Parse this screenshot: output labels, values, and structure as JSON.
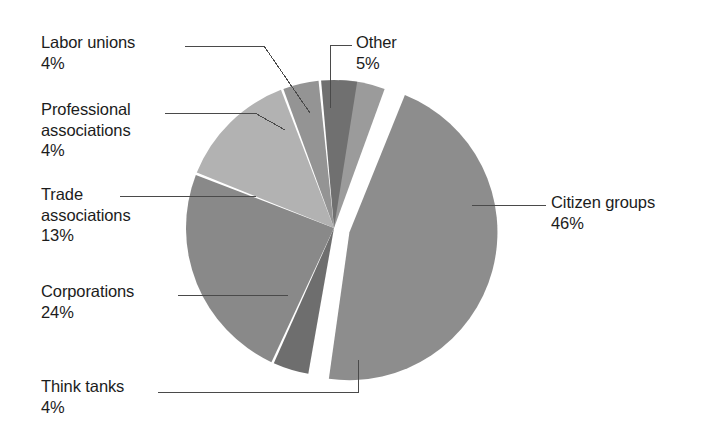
{
  "chart_data": {
    "type": "pie",
    "title": "",
    "subtitle": "",
    "xlabel": "",
    "ylabel": "",
    "legend_position": "none",
    "grid": false,
    "unit": "%",
    "categories": [
      "Other",
      "Citizen groups",
      "Think tanks",
      "Corporations",
      "Trade associations",
      "Professional associations",
      "Labor unions"
    ],
    "values": [
      5,
      46,
      4,
      24,
      13,
      4,
      4
    ],
    "slices": [
      {
        "id": "other",
        "label": "Other",
        "value": 5,
        "value_label": "5%",
        "color": "#9b9b9b",
        "exploded": false,
        "start_angle": 2,
        "end_angle": 20
      },
      {
        "id": "citizen-groups",
        "label": "Citizen groups",
        "value": 46,
        "value_label": "46%",
        "color": "#8d8d8d",
        "exploded": true,
        "start_angle": 22,
        "end_angle": 188
      },
      {
        "id": "think-tanks",
        "label": "Think tanks",
        "value": 4,
        "value_label": "4%",
        "color": "#6e6e6e",
        "exploded": false,
        "start_angle": 190,
        "end_angle": 204
      },
      {
        "id": "corporations",
        "label": "Corporations",
        "value": 24,
        "value_label": "24%",
        "color": "#898989",
        "exploded": false,
        "start_angle": 205,
        "end_angle": 291
      },
      {
        "id": "trade-associations",
        "label": "Trade associations",
        "value": 13,
        "value_label": "13%",
        "color": "#b2b2b2",
        "exploded": false,
        "start_angle": 292,
        "end_angle": 339
      },
      {
        "id": "professional-associations",
        "label": "Professional associations",
        "value": 4,
        "value_label": "4%",
        "color": "#949494",
        "exploded": false,
        "start_angle": 340,
        "end_angle": 354
      },
      {
        "id": "labor-unions",
        "label": "Labor unions",
        "value": 4,
        "value_label": "4%",
        "color": "#707070",
        "exploded": false,
        "start_angle": 355,
        "end_angle": 369
      }
    ]
  },
  "callouts": {
    "labor_unions": {
      "name": "Labor unions",
      "pct": "4%"
    },
    "professional": {
      "name_line1": "Professional",
      "name_line2": "associations",
      "pct": "4%"
    },
    "trade": {
      "name_line1": "Trade",
      "name_line2": "associations",
      "pct": "13%"
    },
    "corporations": {
      "name": "Corporations",
      "pct": "24%"
    },
    "think_tanks": {
      "name": "Think tanks",
      "pct": "4%"
    },
    "other": {
      "name": "Other",
      "pct": "5%"
    },
    "citizen_groups": {
      "name": "Citizen groups",
      "pct": "46%"
    }
  }
}
